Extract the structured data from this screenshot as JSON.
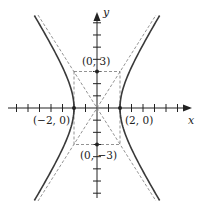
{
  "diagram": {
    "type": "hyperbola",
    "equation": "x^2/4 - y^2/9 = 1",
    "axes": {
      "x_label": "x",
      "y_label": "y"
    },
    "points": [
      {
        "label": "(−2, 0)",
        "x": -2,
        "y": 0,
        "marked": true
      },
      {
        "label": "(2, 0)",
        "x": 2,
        "y": 0,
        "marked": true
      },
      {
        "label": "(0, 3)",
        "x": 0,
        "y": 3,
        "marked": true
      },
      {
        "label": "(0, −3)",
        "x": 0,
        "y": -3,
        "marked": true
      }
    ],
    "asymptotes": [
      "y = 3x/2",
      "y = -3x/2"
    ],
    "fundamental_rectangle": {
      "x": [
        -2,
        2
      ],
      "y": [
        -3,
        3
      ],
      "style": "dashed"
    },
    "colors": {
      "curve": "#3a3a3a",
      "axes": "#222222",
      "dashed": "#777777"
    }
  }
}
